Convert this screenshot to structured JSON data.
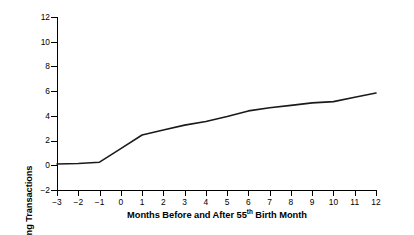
{
  "chart_data": {
    "type": "line",
    "title": "",
    "xlabel": "Months Before and After 55th Birth Month",
    "xlabel_parts": {
      "before": "Months Before and After 55",
      "sup": "th",
      "after": " Birth Month"
    },
    "ylabel": "Number of Cash and Chequeing Transactions",
    "xlim": [
      -3,
      12
    ],
    "ylim": [
      -2,
      12
    ],
    "x_ticks": [
      -3,
      -2,
      -1,
      0,
      1,
      2,
      3,
      4,
      5,
      6,
      7,
      8,
      9,
      10,
      11,
      12
    ],
    "x_tick_labels": [
      "−3",
      "−2",
      "−1",
      "0",
      "1",
      "2",
      "3",
      "4",
      "5",
      "6",
      "7",
      "8",
      "9",
      "10",
      "11",
      "12"
    ],
    "y_ticks": [
      -2,
      0,
      2,
      4,
      6,
      8,
      10,
      12
    ],
    "y_tick_labels": [
      "−2",
      "0",
      "2",
      "4",
      "6",
      "8",
      "10",
      "12"
    ],
    "grid": false,
    "legend": false,
    "legend_position": "none",
    "line_color": "#1a1a1a",
    "line_width": 1.6,
    "background_color": "#ffffff",
    "axis_color": "#000000",
    "x": [
      -3,
      -2,
      -1,
      0,
      1,
      2,
      3,
      4,
      5,
      6,
      7,
      8,
      9,
      10,
      11,
      12
    ],
    "series": [
      {
        "name": "Number of Cash and Chequeing Transactions",
        "values": [
          0.1,
          0.15,
          0.25,
          1.35,
          2.45,
          2.85,
          3.25,
          3.55,
          3.95,
          4.4,
          4.65,
          4.85,
          5.05,
          5.15,
          5.5,
          5.85
        ]
      }
    ]
  }
}
